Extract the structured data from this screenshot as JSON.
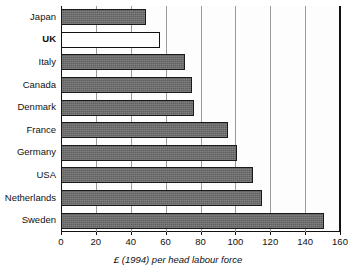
{
  "chart_data": {
    "type": "bar",
    "orientation": "horizontal",
    "title": "",
    "xlabel": "£ (1994) per head labour force",
    "ylabel": "",
    "xlim": [
      0,
      160
    ],
    "xticks": [
      0,
      20,
      40,
      60,
      80,
      100,
      120,
      140,
      160
    ],
    "xtick_labels": [
      "0",
      "20",
      "40",
      "60",
      "80",
      "100",
      "120",
      "140",
      "160"
    ],
    "grid": true,
    "grid_axis": "x",
    "legend": null,
    "categories": [
      "Japan",
      "UK",
      "Italy",
      "Canada",
      "Denmark",
      "France",
      "Germany",
      "USA",
      "Netherlands",
      "Sweden"
    ],
    "values": [
      49,
      57,
      71,
      75,
      76,
      96,
      101,
      110,
      115,
      151
    ],
    "bar_colors": [
      "#6e6e6e",
      "#ffffff",
      "#6e6e6e",
      "#6e6e6e",
      "#6e6e6e",
      "#6e6e6e",
      "#6e6e6e",
      "#6e6e6e",
      "#6e6e6e",
      "#6e6e6e"
    ],
    "highlight_category": "UK",
    "bar_edge_color": "#1a1a1a",
    "gridline_color": "#9a9a9a",
    "axis_color": "#111111"
  }
}
